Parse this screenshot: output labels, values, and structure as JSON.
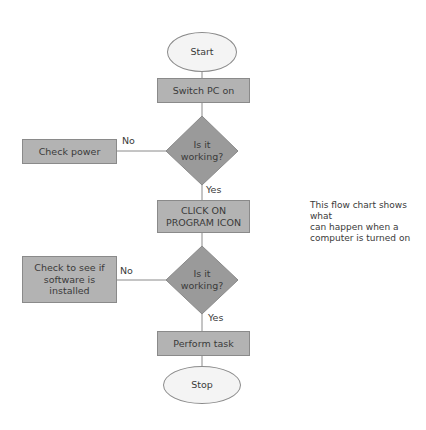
{
  "caption_fragment": "... top caption line cut off ...",
  "diagram": {
    "type": "flowchart",
    "colors": {
      "process_fill": "#b3b3b3",
      "decision_fill": "#9a9a9a",
      "terminal_fill": "#f4f4f4",
      "stroke": "#8a8a8a",
      "text": "#3a3a3a"
    },
    "nodes": {
      "start": {
        "shape": "ellipse",
        "label": "Start"
      },
      "switch_on": {
        "shape": "rectangle",
        "label": "Switch PC on"
      },
      "decision1": {
        "shape": "diamond",
        "label_line1": "Is it",
        "label_line2": "working?"
      },
      "check_power": {
        "shape": "rectangle",
        "label": "Check power"
      },
      "click_icon": {
        "shape": "rectangle",
        "label_line1": "CLICK ON",
        "label_line2": "PROGRAM ICON"
      },
      "decision2": {
        "shape": "diamond",
        "label_line1": "Is it",
        "label_line2": "working?"
      },
      "check_software": {
        "shape": "rectangle",
        "label_line1": "Check to see if",
        "label_line2": "software is",
        "label_line3": "installed"
      },
      "perform_task": {
        "shape": "rectangle",
        "label": "Perform task"
      },
      "stop": {
        "shape": "ellipse",
        "label": "Stop"
      }
    },
    "edges": [
      {
        "from": "start",
        "to": "switch_on",
        "label": ""
      },
      {
        "from": "switch_on",
        "to": "decision1",
        "label": ""
      },
      {
        "from": "decision1",
        "to": "check_power",
        "label": "No"
      },
      {
        "from": "decision1",
        "to": "click_icon",
        "label": "Yes"
      },
      {
        "from": "click_icon",
        "to": "decision2",
        "label": ""
      },
      {
        "from": "decision2",
        "to": "check_software",
        "label": "No"
      },
      {
        "from": "decision2",
        "to": "perform_task",
        "label": "Yes"
      },
      {
        "from": "perform_task",
        "to": "stop",
        "label": ""
      }
    ],
    "edge_labels": {
      "d1_no": "No",
      "d1_yes": "Yes",
      "d2_no": "No",
      "d2_yes": "Yes"
    }
  },
  "note": {
    "line1": "This flow chart shows what",
    "line2": "can happen when a",
    "line3": "computer is turned on"
  }
}
